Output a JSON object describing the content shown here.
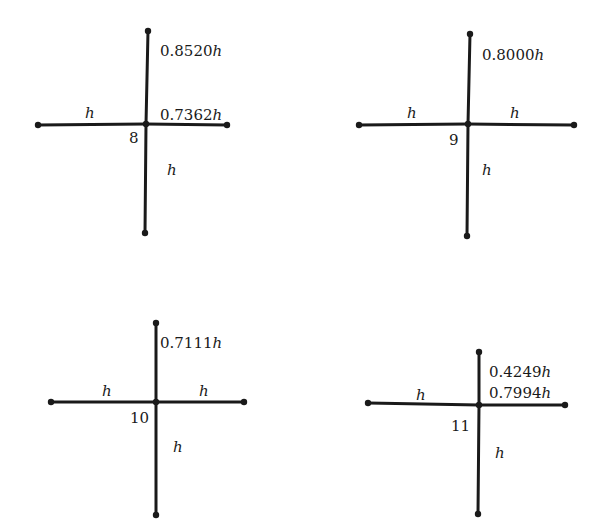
{
  "diagram": {
    "stencils": [
      {
        "id": "8",
        "node_label": "8",
        "center": [
          146,
          124
        ],
        "arms": {
          "up": {
            "end": [
              148,
              31
            ],
            "coef": "0.8520",
            "label": "0.8520h"
          },
          "down": {
            "end": [
              145,
              233
            ],
            "coef": "",
            "label": "h"
          },
          "left": {
            "end": [
              38,
              125
            ],
            "coef": "",
            "label": "h"
          },
          "right": {
            "end": [
              227,
              125
            ],
            "coef": "0.7362",
            "label": "0.7362h"
          }
        }
      },
      {
        "id": "9",
        "node_label": "9",
        "center": [
          468,
          124
        ],
        "arms": {
          "up": {
            "end": [
              470,
              34
            ],
            "coef": "0.8000",
            "label": "0.8000h"
          },
          "down": {
            "end": [
              467,
              236
            ],
            "coef": "",
            "label": "h"
          },
          "left": {
            "end": [
              359,
              125
            ],
            "coef": "",
            "label": "h"
          },
          "right": {
            "end": [
              574,
              125
            ],
            "coef": "",
            "label": "h"
          }
        }
      },
      {
        "id": "10",
        "node_label": "10",
        "center": [
          156,
          402
        ],
        "arms": {
          "up": {
            "end": [
              156,
              323
            ],
            "coef": "0.7111",
            "label": "0.7111h"
          },
          "down": {
            "end": [
              156,
              515
            ],
            "coef": "",
            "label": "h"
          },
          "left": {
            "end": [
              51,
              402
            ],
            "coef": "",
            "label": "h"
          },
          "right": {
            "end": [
              244,
              402
            ],
            "coef": "",
            "label": "h"
          }
        }
      },
      {
        "id": "11",
        "node_label": "11",
        "center": [
          479,
          405
        ],
        "arms": {
          "up": {
            "end": [
              479,
              352
            ],
            "coef": "0.4249",
            "label": "0.4249h"
          },
          "down": {
            "end": [
              478,
              514
            ],
            "coef": "",
            "label": "h"
          },
          "left": {
            "end": [
              368,
              403
            ],
            "coef": "",
            "label": "h"
          },
          "right": {
            "end": [
              565,
              405
            ],
            "coef": "0.7994",
            "label": "0.7994h"
          }
        }
      }
    ]
  }
}
